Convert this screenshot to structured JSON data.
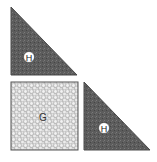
{
  "diagram": {
    "pieces": [
      {
        "id": "top-triangle",
        "label": "H",
        "shape": "right-triangle",
        "fill": "#5a5a5a"
      },
      {
        "id": "square",
        "label": "G",
        "shape": "square",
        "fill": "#dcdcdc"
      },
      {
        "id": "right-triangle",
        "label": "H",
        "shape": "right-triangle",
        "fill": "#5a5a5a"
      }
    ],
    "colors": {
      "dark_fabric": "#5a5a5a",
      "light_fabric": "#dcdcdc",
      "outline": "#555555",
      "label_circle": "#ffffff"
    }
  }
}
